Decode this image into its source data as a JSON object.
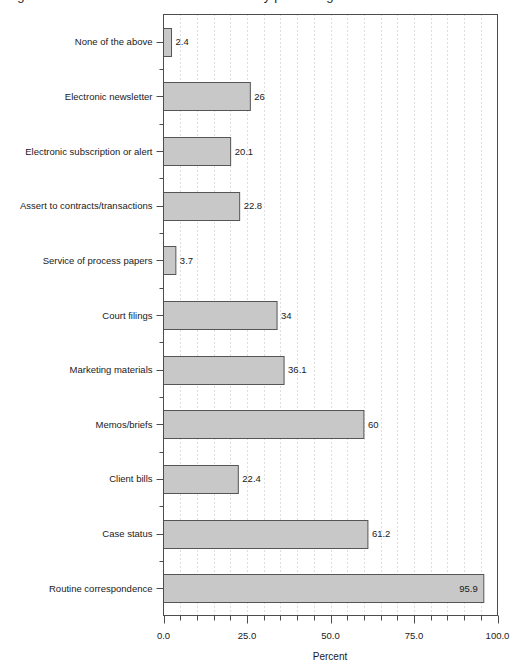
{
  "figure": {
    "cropped_title": "Figure: Uses of electronic communication by percentage",
    "background_color": "#ffffff"
  },
  "chart_data": {
    "type": "bar",
    "orientation": "horizontal",
    "title": "",
    "xlabel": "Percent",
    "ylabel": "",
    "xlim": [
      0,
      100
    ],
    "ylim": null,
    "grid": "vertical-dotted",
    "legend": "none",
    "bar_fill_color": "#c8c8c8",
    "bar_edge_color": "#555555",
    "grid_color": "#bdbdbd",
    "axis_color": "#4d4d4d",
    "xticks": [
      0,
      25,
      50,
      75,
      100
    ],
    "xticklabels": [
      "0.0",
      "25.0",
      "50.0",
      "75.0",
      "100.0"
    ],
    "minor_tick_step": 5,
    "categories": [
      "None of the above",
      "Electronic newsletter",
      "Electronic subscription or alert",
      "Assert to contracts/transactions",
      "Service of process papers",
      "Court filings",
      "Marketing materials",
      "Memos/briefs",
      "Client bills",
      "Case status",
      "Routine correspondence"
    ],
    "values": [
      2.4,
      26,
      20.1,
      22.8,
      3.7,
      34,
      36.1,
      60,
      22.4,
      61.2,
      95.9
    ],
    "value_labels": [
      "2.4",
      "26",
      "20.1",
      "22.8",
      "3.7",
      "34",
      "36.1",
      "60",
      "22.4",
      "61.2",
      "95.9"
    ],
    "label_inside_bar": [
      false,
      false,
      false,
      false,
      false,
      false,
      false,
      false,
      false,
      false,
      true
    ]
  }
}
